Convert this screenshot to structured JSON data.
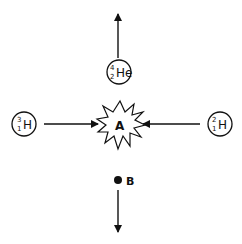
{
  "diagram": {
    "title": "",
    "center": {
      "label": "A",
      "shape": "starburst-explosion"
    },
    "products_below": {
      "label": "B",
      "marker": "filled-dot",
      "direction": "down"
    },
    "particles": [
      {
        "id": "helium-4",
        "symbol": "He",
        "mass": "4",
        "atomic": "2",
        "position": "top",
        "direction": "up"
      },
      {
        "id": "tritium",
        "symbol": "H",
        "mass": "3",
        "atomic": "1",
        "position": "left",
        "direction": "right-into-A"
      },
      {
        "id": "deuterium",
        "symbol": "H",
        "mass": "2",
        "atomic": "1",
        "position": "right",
        "direction": "left-into-A"
      }
    ],
    "colors": {
      "stroke": "#111111",
      "background": "#ffffff"
    }
  }
}
